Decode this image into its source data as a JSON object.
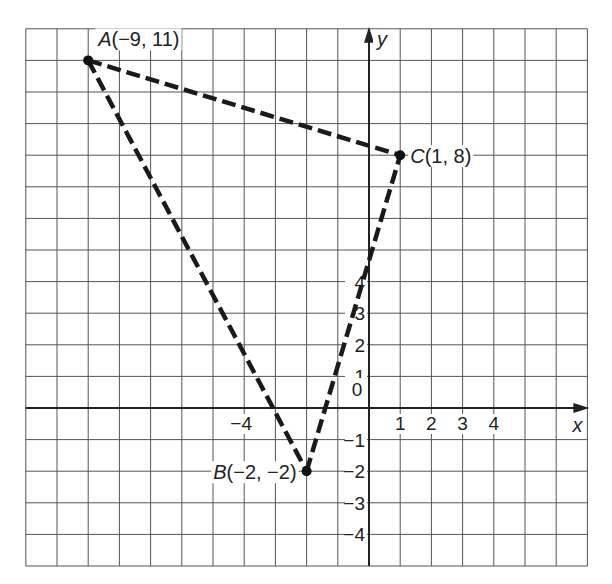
{
  "diagram": {
    "title": "",
    "type": "coordinate-plane-triangle",
    "grid": {
      "x_min": -11,
      "x_max": 7,
      "y_min": -5,
      "y_max": 12,
      "gridlines": true
    },
    "axes": {
      "x_label": "x",
      "y_label": "y"
    },
    "x_ticks": [
      {
        "value": -4,
        "label": "−4"
      },
      {
        "value": 1,
        "label": "1"
      },
      {
        "value": 2,
        "label": "2"
      },
      {
        "value": 3,
        "label": "3"
      },
      {
        "value": 4,
        "label": "4"
      }
    ],
    "y_ticks": [
      {
        "value": 4,
        "label": "4"
      },
      {
        "value": 3,
        "label": "3"
      },
      {
        "value": 2,
        "label": "2"
      },
      {
        "value": 1,
        "label": "1"
      },
      {
        "value": -1,
        "label": "−1"
      },
      {
        "value": -2,
        "label": "−2"
      },
      {
        "value": -3,
        "label": "−3"
      },
      {
        "value": -4,
        "label": "−4"
      }
    ],
    "origin_label": "0",
    "points": [
      {
        "name": "A",
        "x": -9,
        "y": 11,
        "label": "A(−9, 11)"
      },
      {
        "name": "B",
        "x": -2,
        "y": -2,
        "label": "B(−2, −2)"
      },
      {
        "name": "C",
        "x": 1,
        "y": 8,
        "label": "C(1, 8)"
      }
    ],
    "segments": [
      {
        "from": "A",
        "to": "C",
        "style": "dashed"
      },
      {
        "from": "A",
        "to": "B",
        "style": "dashed"
      },
      {
        "from": "B",
        "to": "C",
        "style": "dashed"
      }
    ],
    "colors": {
      "grid": "#555555",
      "line": "#1a1a1a",
      "background": "#ffffff"
    }
  }
}
